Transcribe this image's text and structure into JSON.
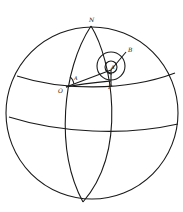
{
  "figure": {
    "type": "spherical geometry diagram",
    "labels": {
      "north": "N",
      "origin": "O",
      "point_a": "A",
      "point_b": "B",
      "point_p": "P",
      "angle_at_o": "A"
    },
    "colors": {
      "line": "#1a1a1a",
      "background": "#ffffff"
    }
  }
}
